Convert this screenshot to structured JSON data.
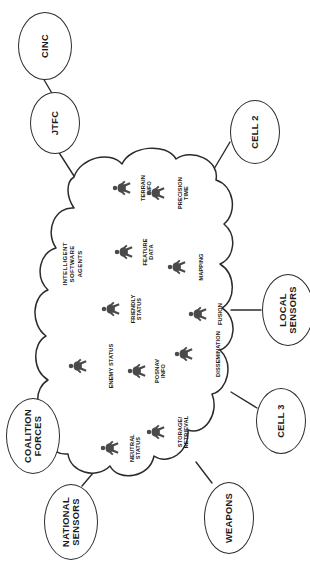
{
  "diagram": {
    "orientation": "rotated-90-clockwise",
    "cloud_label": "INTELLIGENT\nSOFTWARE\nAGENTS",
    "stroke_color": "#2b2b2b",
    "figure_color": "#4a4a4a",
    "background": "#ffffff"
  },
  "agents": [
    {
      "id": "terrain-info",
      "label": "TERRAIN\nINFO",
      "x": 112,
      "y": 178
    },
    {
      "id": "precision-time",
      "label": "PRECISION\nTIME",
      "x": 146,
      "y": 183
    },
    {
      "id": "feature-data",
      "label": "FEATURE\nDATA",
      "x": 114,
      "y": 242
    },
    {
      "id": "mapping",
      "label": "MAPPING",
      "x": 167,
      "y": 257
    },
    {
      "id": "friendly-status",
      "label": "FRIENDLY\nSTATUS",
      "x": 101,
      "y": 299
    },
    {
      "id": "fusion",
      "label": "FUSION",
      "x": 188,
      "y": 304
    },
    {
      "id": "enemy-status",
      "label": "ENEMY STATUS",
      "x": 68,
      "y": 356
    },
    {
      "id": "posnav-info",
      "label": "POSNAV\nINFO",
      "x": 127,
      "y": 361
    },
    {
      "id": "dissemination",
      "label": "DISSEMINATION",
      "x": 174,
      "y": 344
    },
    {
      "id": "storage-retrieval",
      "label": "STORAGE/\nRETRIEVAL",
      "x": 146,
      "y": 422
    },
    {
      "id": "neutral-status",
      "label": "NEUTRAL\nSTATUS",
      "x": 100,
      "y": 438
    }
  ],
  "nodes": [
    {
      "id": "cinc",
      "label": "CINC",
      "x": 18,
      "y": 12,
      "w": 54,
      "h": 68
    },
    {
      "id": "jtfc",
      "label": "JTFC",
      "x": 30,
      "y": 92,
      "w": 50,
      "h": 62
    },
    {
      "id": "cell-2",
      "label": "CELL 2",
      "x": 230,
      "y": 100,
      "w": 50,
      "h": 64
    },
    {
      "id": "local-sensors",
      "label": "LOCAL\nSENSORS",
      "x": 262,
      "y": 274,
      "w": 52,
      "h": 72
    },
    {
      "id": "cell-3",
      "label": "CELL 3",
      "x": 256,
      "y": 388,
      "w": 50,
      "h": 66
    },
    {
      "id": "weapons",
      "label": "WEAPONS",
      "x": 204,
      "y": 482,
      "w": 50,
      "h": 72
    },
    {
      "id": "national-sensors",
      "label": "NATIONAL\nSENSORS",
      "x": 44,
      "y": 484,
      "w": 54,
      "h": 76
    },
    {
      "id": "coalition-forces",
      "label": "COALITION\nFORCES",
      "x": 6,
      "y": 398,
      "w": 54,
      "h": 76
    }
  ],
  "connections": [
    {
      "from": "cinc",
      "to": "jtfc"
    },
    {
      "from": "jtfc",
      "to": "cloud"
    },
    {
      "from": "cell-2",
      "to": "cloud"
    },
    {
      "from": "local-sensors",
      "to": "cloud"
    },
    {
      "from": "cell-3",
      "to": "cloud"
    },
    {
      "from": "weapons",
      "to": "cloud"
    },
    {
      "from": "national-sensors",
      "to": "cloud"
    },
    {
      "from": "coalition-forces",
      "to": "cloud"
    }
  ]
}
